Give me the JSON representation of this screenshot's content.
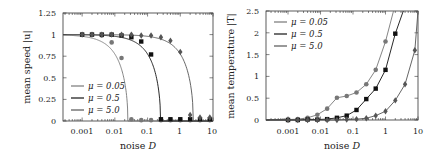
{
  "chart_data": [
    {
      "type": "line",
      "title": "",
      "xlabel": "noise D",
      "ylabel": "mean speed |u|",
      "xscale": "log",
      "xlim": [
        0.00026,
        10
      ],
      "ylim": [
        0,
        1.25
      ],
      "xticks": [
        "0.001",
        "0.01",
        "0.1",
        "1",
        "10"
      ],
      "yticks": [
        "0",
        "0.25",
        "0.5",
        "0.75",
        "1",
        "1.25"
      ],
      "legend": {
        "position": "lower left",
        "entries": [
          "μ = 0.05",
          "μ = 0.5",
          "μ = 5.0"
        ]
      },
      "series": [
        {
          "name": "μ = 0.05",
          "color": "#777777",
          "marker": "circle",
          "curve_Dc": 0.025,
          "points": [
            [
              0.001,
              1.0
            ],
            [
              0.002,
              1.0
            ],
            [
              0.004,
              0.99
            ],
            [
              0.008,
              0.91
            ],
            [
              0.016,
              0.73
            ],
            [
              0.032,
              0.02
            ],
            [
              0.064,
              0.01
            ],
            [
              0.128,
              0.01
            ],
            [
              0.256,
              0.01
            ],
            [
              0.5,
              0.01
            ],
            [
              1,
              0.01
            ],
            [
              2,
              0.01
            ],
            [
              4,
              0.01
            ],
            [
              8,
              0.01
            ]
          ]
        },
        {
          "name": "μ = 0.5",
          "color": "#111111",
          "marker": "square",
          "curve_Dc": 0.25,
          "points": [
            [
              0.001,
              1.0
            ],
            [
              0.002,
              1.0
            ],
            [
              0.004,
              1.0
            ],
            [
              0.008,
              1.0
            ],
            [
              0.016,
              0.99
            ],
            [
              0.032,
              0.97
            ],
            [
              0.064,
              0.92
            ],
            [
              0.128,
              0.77
            ],
            [
              0.256,
              0.02
            ],
            [
              0.5,
              0.02
            ],
            [
              1,
              0.02
            ],
            [
              2,
              0.02
            ],
            [
              4,
              0.02
            ],
            [
              8,
              0.02
            ]
          ]
        },
        {
          "name": "μ = 5.0",
          "color": "#555555",
          "marker": "diamond",
          "curve_Dc": 2.5,
          "points": [
            [
              0.001,
              1.0
            ],
            [
              0.002,
              1.0
            ],
            [
              0.004,
              1.0
            ],
            [
              0.008,
              1.0
            ],
            [
              0.016,
              1.0
            ],
            [
              0.032,
              1.0
            ],
            [
              0.064,
              0.99
            ],
            [
              0.128,
              0.99
            ],
            [
              0.256,
              0.97
            ],
            [
              0.5,
              0.93
            ],
            [
              1,
              0.8
            ],
            [
              2,
              0.07
            ],
            [
              4,
              0.04
            ],
            [
              8,
              0.04
            ]
          ]
        }
      ]
    },
    {
      "type": "line",
      "title": "",
      "xlabel": "noise D",
      "ylabel": "mean temperature |T|",
      "xscale": "log",
      "xlim": [
        0.00021,
        10
      ],
      "ylim": [
        0,
        2.5
      ],
      "xticks": [
        "0.001",
        "0.01",
        "0.1",
        "1",
        "10"
      ],
      "yticks": [
        "0",
        "0.5",
        "1",
        "1.5",
        "2",
        "2.5"
      ],
      "legend": {
        "position": "upper left",
        "entries": [
          "μ = 0.05",
          "μ = 0.5",
          "μ = 5.0"
        ]
      },
      "series": [
        {
          "name": "μ = 0.05",
          "color": "#777777",
          "marker": "circle",
          "points": [
            [
              0.001,
              0.01
            ],
            [
              0.002,
              0.02
            ],
            [
              0.004,
              0.05
            ],
            [
              0.008,
              0.12
            ],
            [
              0.016,
              0.26
            ],
            [
              0.032,
              0.51
            ],
            [
              0.064,
              0.55
            ],
            [
              0.128,
              0.63
            ],
            [
              0.256,
              0.82
            ],
            [
              0.5,
              1.15
            ],
            [
              1,
              1.8
            ]
          ]
        },
        {
          "name": "μ = 0.5",
          "color": "#111111",
          "marker": "square",
          "points": [
            [
              0.001,
              0.0
            ],
            [
              0.002,
              0.0
            ],
            [
              0.004,
              0.01
            ],
            [
              0.008,
              0.01
            ],
            [
              0.016,
              0.02
            ],
            [
              0.032,
              0.05
            ],
            [
              0.064,
              0.1
            ],
            [
              0.128,
              0.23
            ],
            [
              0.256,
              0.48
            ],
            [
              0.5,
              0.72
            ],
            [
              1,
              1.15
            ],
            [
              2,
              1.98
            ]
          ]
        },
        {
          "name": "μ = 5.0",
          "color": "#555555",
          "marker": "diamond",
          "points": [
            [
              0.001,
              0.0
            ],
            [
              0.002,
              0.0
            ],
            [
              0.004,
              0.0
            ],
            [
              0.008,
              0.0
            ],
            [
              0.016,
              0.0
            ],
            [
              0.032,
              0.0
            ],
            [
              0.064,
              0.01
            ],
            [
              0.128,
              0.02
            ],
            [
              0.256,
              0.04
            ],
            [
              0.5,
              0.1
            ],
            [
              1,
              0.2
            ],
            [
              2,
              0.45
            ],
            [
              4,
              0.82
            ],
            [
              8,
              1.6
            ]
          ]
        }
      ]
    }
  ],
  "panels": {
    "left": {
      "ylabel": "mean speed |u|",
      "xlabel_text": "noise ",
      "xlabel_var": "D",
      "yticks": [
        "1.25",
        "1",
        "0.75",
        "0.5",
        "0.25",
        "0"
      ],
      "xticks": [
        "0.001",
        "0.01",
        "0.1",
        "1",
        "10"
      ],
      "legend": [
        "μ = 0.05",
        "μ = 0.5",
        "μ = 5.0"
      ]
    },
    "right": {
      "ylabel": "mean temperature |T|",
      "xlabel_text": "noise ",
      "xlabel_var": "D",
      "yticks": [
        "2.5",
        "2",
        "1.5",
        "1",
        "0.5",
        "0"
      ],
      "xticks": [
        "0.001",
        "0.01",
        "0.1",
        "1",
        "10"
      ],
      "legend": [
        "μ = 0.05",
        "μ = 0.5",
        "μ = 5.0"
      ]
    }
  }
}
